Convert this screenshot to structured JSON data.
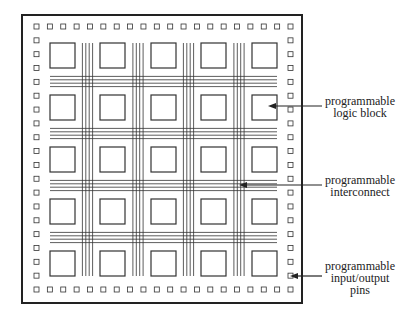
{
  "diagram": {
    "colors": {
      "line": "#333333",
      "frame": "#222222",
      "text": "#222222",
      "background": "#ffffff"
    },
    "frame": {
      "x": 22,
      "y": 15,
      "width": 280,
      "height": 288
    },
    "logic_blocks": {
      "rows": 5,
      "cols": 5,
      "x": [
        50,
        100,
        151,
        201,
        252
      ],
      "y": [
        43,
        95,
        147,
        199,
        251
      ],
      "size": 25
    },
    "interconnect": {
      "lines_per_channel": 4,
      "line_spacing": 3.4
    },
    "io_pins": {
      "per_side": 20,
      "size": 5
    },
    "annotations": [
      {
        "id": "logic-block",
        "lines": [
          "programmable",
          "logic block"
        ],
        "arrow_y": 106,
        "arrow_from_x": 322,
        "arrow_to_x": 268
      },
      {
        "id": "interconnect",
        "lines": [
          "programmable",
          "interconnect"
        ],
        "arrow_y": 185,
        "arrow_from_x": 322,
        "arrow_to_x": 239
      },
      {
        "id": "io-pins",
        "lines": [
          "programmable",
          "input/output",
          "pins"
        ],
        "arrow_y": 276,
        "arrow_from_x": 322,
        "arrow_to_x": 290
      }
    ]
  }
}
